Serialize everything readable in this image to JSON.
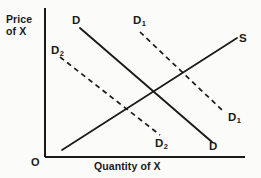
{
  "figure": {
    "type": "economics-supply-demand-diagram",
    "axes": {
      "y_axis_label_line1": "Price",
      "y_axis_label_line2": "of X",
      "x_axis_label": "Quantity of X",
      "origin_label": "O",
      "y_axis": {
        "x": 45,
        "y_top": 8,
        "y_bottom": 157
      },
      "x_axis": {
        "y": 157,
        "x_left": 45,
        "x_right": 245
      }
    },
    "colors": {
      "line": "#1a1a1a",
      "axis": "#1a1a1a",
      "background": "#fbfbfa",
      "text": "#1a1a1a"
    },
    "curves": [
      {
        "id": "supply",
        "label": "S",
        "style": "solid",
        "slope": "upward",
        "x1": 62,
        "y1": 150,
        "x2": 237,
        "y2": 38,
        "label_x": 239,
        "label_y": 32
      },
      {
        "id": "demand-original",
        "label": "D",
        "subscript": "",
        "style": "solid",
        "slope": "downward",
        "x1": 80,
        "y1": 28,
        "x2": 212,
        "y2": 142,
        "label_top_x": 72,
        "label_top_y": 14,
        "label_bottom_x": 209,
        "label_bottom_y": 140
      },
      {
        "id": "demand-increase",
        "label": "D",
        "subscript": "1",
        "style": "dashed",
        "slope": "downward",
        "x1": 140,
        "y1": 32,
        "x2": 222,
        "y2": 110,
        "label_top_x": 133,
        "label_top_y": 14,
        "label_end_x": 228,
        "label_end_y": 111
      },
      {
        "id": "demand-decrease",
        "label": "D",
        "subscript": "2",
        "style": "dashed",
        "slope": "downward",
        "x1": 60,
        "y1": 57,
        "x2": 160,
        "y2": 135,
        "label_top_x": 51,
        "label_top_y": 44,
        "label_end_x": 155,
        "label_end_y": 137
      }
    ],
    "labels": {
      "d_top": "D",
      "d1_top": "D",
      "d1_top_sub": "1",
      "s": "S",
      "d2_left": "D",
      "d2_left_sub": "2",
      "d1_right": "D",
      "d1_right_sub": "1",
      "d2_bottom": "D",
      "d2_bottom_sub": "2",
      "d_bottom": "D"
    },
    "equilibrium": {
      "x": 155,
      "y": 93,
      "described": "intersection of D and S"
    }
  }
}
